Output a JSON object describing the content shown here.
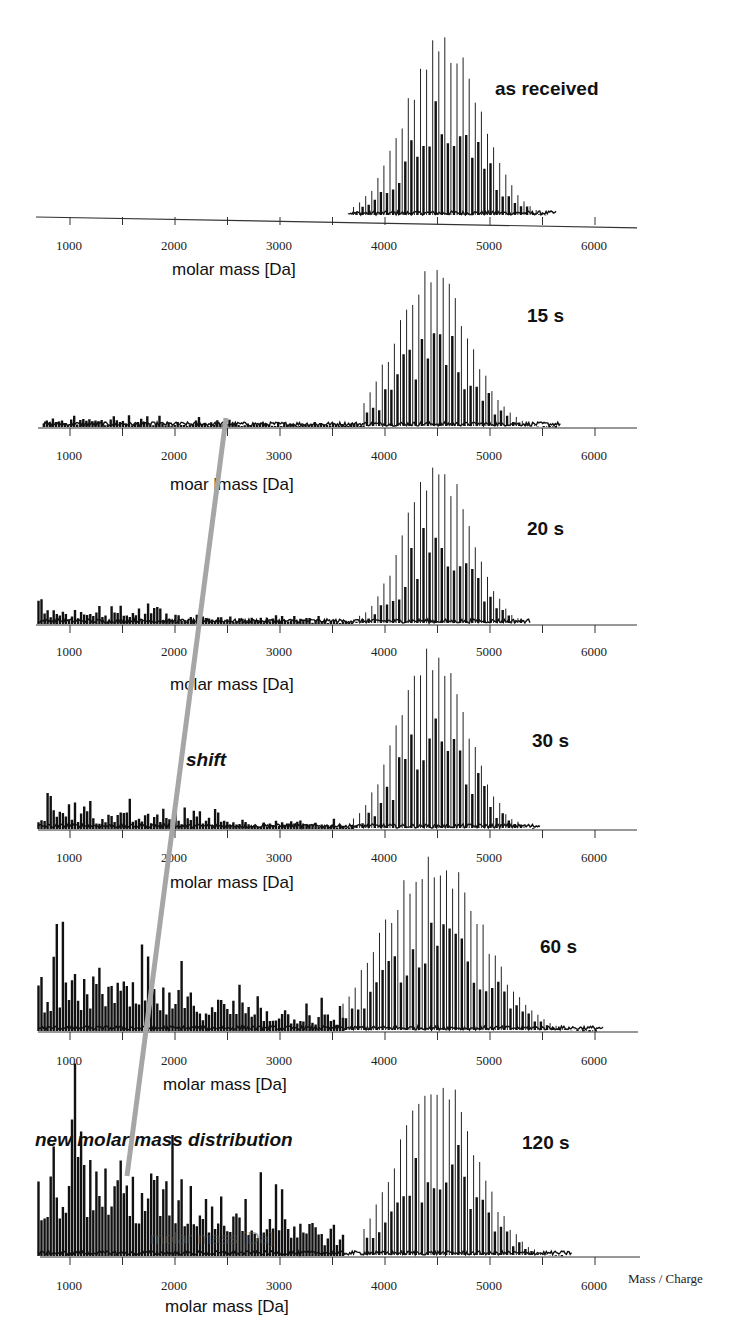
{
  "chart_data": {
    "type": "line",
    "title": "",
    "xlabel": "molar mass [Da]",
    "secondary_xlabel": "Mass / Charge",
    "xlim": [
      700,
      6400
    ],
    "x_ticks": [
      1000,
      2000,
      3000,
      4000,
      5000,
      6000
    ],
    "x_minor_ticks": [
      1500,
      2500,
      3500,
      4500,
      5500
    ],
    "grid": false,
    "y_axis_visible": false,
    "panels": [
      {
        "label": "as received",
        "xlabel": "molar mass [Da]",
        "main_peak_center": 4550,
        "main_peak_range": [
          3700,
          5550
        ],
        "main_peak_rel_height": 1.0,
        "low_mass_rel_height": 0.0
      },
      {
        "label": "15 s",
        "xlabel": "moar lmass [Da]",
        "main_peak_center": 4450,
        "main_peak_range": [
          3800,
          5600
        ],
        "main_peak_rel_height": 1.0,
        "low_mass_rel_height": 0.06,
        "low_mass_range": [
          750,
          3800
        ]
      },
      {
        "label": "20 s",
        "xlabel": "molar mass [Da]",
        "main_peak_center": 4500,
        "main_peak_range": [
          3700,
          5300
        ],
        "main_peak_rel_height": 1.0,
        "low_mass_rel_height": 0.1,
        "low_mass_range": [
          700,
          3700
        ]
      },
      {
        "label": "30 s",
        "xlabel": "molar mass [Da]",
        "main_peak_center": 4450,
        "main_peak_range": [
          3700,
          5400
        ],
        "main_peak_rel_height": 1.0,
        "low_mass_rel_height": 0.12,
        "low_mass_range": [
          700,
          3700
        ]
      },
      {
        "label": "60 s",
        "xlabel": "molar mass [Da]",
        "main_peak_center": 4450,
        "main_peak_range": [
          3600,
          6000
        ],
        "main_peak_rel_height": 1.0,
        "low_mass_rel_height": 0.35,
        "low_mass_range": [
          700,
          3600
        ]
      },
      {
        "label": "120 s",
        "xlabel": "molar mass [Da]",
        "main_peak_center": 4500,
        "main_peak_range": [
          3800,
          5700
        ],
        "main_peak_rel_height": 1.0,
        "low_mass_rel_height": 0.65,
        "low_mass_range": [
          700,
          3600
        ]
      }
    ],
    "annotations": [
      {
        "text": "shift",
        "style": "bold italic"
      },
      {
        "text": "new molar mass distribution",
        "style": "bold italic"
      }
    ],
    "shift_line": {
      "color": "#a6a6a6",
      "from_mass": 2500,
      "to_mass": 1500,
      "from_panel": "15 s",
      "to_panel": "120 s"
    },
    "legend": null
  },
  "figure": {
    "panel_labels": [
      "as received",
      "15 s",
      "20 s",
      "30 s",
      "60 s",
      "120 s"
    ],
    "axis_labels": [
      "molar mass [Da]",
      "moar lmass [Da]",
      "molar mass [Da]",
      "molar mass [Da]",
      "molar mass [Da]",
      "molar mass [Da]"
    ],
    "tick_labels": [
      "1000",
      "2000",
      "3000",
      "4000",
      "5000",
      "6000"
    ],
    "shift_label": "shift",
    "new_dist_label": "new molar mass distribution",
    "mass_charge_label": "Mass / Charge",
    "ghost_label": "molar mass [Da]",
    "colors": {
      "trace": "#111111",
      "axis": "#333333",
      "shift_line": "#a6a6a6",
      "background": "#ffffff"
    }
  }
}
